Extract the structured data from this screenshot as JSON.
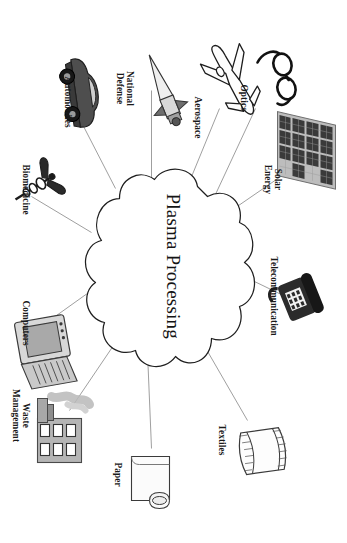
{
  "figure": {
    "type": "concept-map",
    "orientation": "rotated-90-clockwise",
    "background_color": "#ffffff",
    "line_color": "#8a8a8a",
    "text_color": "#1a1a1a"
  },
  "center": {
    "label": "Plasma Processing",
    "shape": "cloud",
    "fill": "#ffffff",
    "stroke": "#222222"
  },
  "nodes": [
    {
      "id": "optics",
      "label": "Optics",
      "label_lines": [
        "Optics"
      ],
      "icon": "eyeglasses-icon"
    },
    {
      "id": "solar-energy",
      "label": "Solar Energy",
      "label_lines": [
        "Solar",
        "Energy"
      ],
      "icon": "solar-panel-icon"
    },
    {
      "id": "telecommunication",
      "label": "Telecommunication",
      "label_lines": [
        "Telecommunication"
      ],
      "icon": "telephone-icon"
    },
    {
      "id": "textiles",
      "label": "Textiles",
      "label_lines": [
        "Textiles"
      ],
      "icon": "fabric-roll-icon"
    },
    {
      "id": "paper",
      "label": "Paper",
      "label_lines": [
        "Paper"
      ],
      "icon": "paper-roll-icon"
    },
    {
      "id": "waste-management",
      "label": "Waste Management",
      "label_lines": [
        "Waste",
        "Management"
      ],
      "icon": "factory-icon"
    },
    {
      "id": "computers",
      "label": "Computers",
      "label_lines": [
        "Computers"
      ],
      "icon": "computer-icon"
    },
    {
      "id": "biomedicine",
      "label": "Biomedicine",
      "label_lines": [
        "Biomedicine"
      ],
      "icon": "caduceus-icon"
    },
    {
      "id": "automobiles",
      "label": "Automobiles",
      "label_lines": [
        "Automobiles"
      ],
      "icon": "car-icon"
    },
    {
      "id": "national-defense",
      "label": "National Defense",
      "label_lines": [
        "National",
        "Defense"
      ],
      "icon": "missile-icon"
    },
    {
      "id": "aerospace",
      "label": "Aerospace",
      "label_lines": [
        "Aerospace"
      ],
      "icon": "airplane-icon"
    }
  ]
}
